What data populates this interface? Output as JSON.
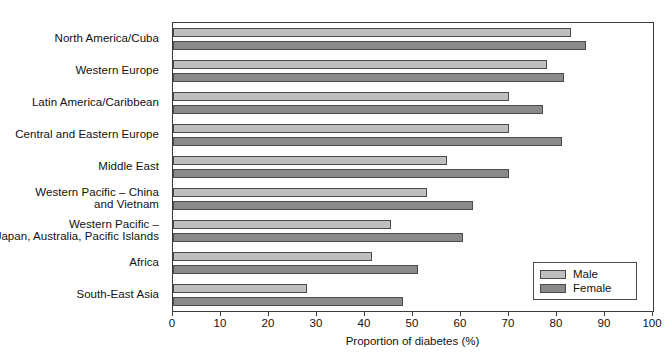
{
  "chart_data": {
    "type": "bar",
    "orientation": "horizontal",
    "title": "",
    "xlabel": "Proportion of diabetes (%)",
    "ylabel": "",
    "xlim": [
      0,
      100
    ],
    "xticks": [
      0,
      10,
      20,
      30,
      40,
      50,
      60,
      70,
      80,
      90,
      100
    ],
    "xtick_labels": [
      "0",
      "10",
      "20",
      "30",
      "40",
      "50",
      "60",
      "70",
      "80",
      "90",
      "100"
    ],
    "grid": false,
    "legend_position": "bottom-right",
    "categories": [
      "North America/Cuba",
      "Western Europe",
      "Latin America/Caribbean",
      "Central and Eastern Europe",
      "Middle East",
      "Western Pacific – China\nand Vietnam",
      "Western Pacific –\nJapan, Australia, Pacific Islands",
      "Africa",
      "South-East Asia"
    ],
    "series": [
      {
        "name": "Male",
        "color": "#bfbfbf",
        "values": [
          83,
          78,
          70,
          70,
          57,
          53,
          45.5,
          41.5,
          28
        ]
      },
      {
        "name": "Female",
        "color": "#8a8a8a",
        "values": [
          86,
          81.5,
          77,
          81,
          70,
          62.5,
          60.5,
          51,
          48
        ]
      }
    ]
  },
  "legend": {
    "entries": [
      {
        "label": "Male"
      },
      {
        "label": "Female"
      }
    ]
  },
  "axis": {
    "x_title": "Proportion of diabetes (%)"
  }
}
